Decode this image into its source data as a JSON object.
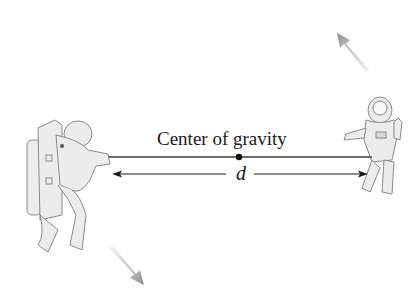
{
  "diagram": {
    "labels": {
      "center_of_gravity": "Center of gravity",
      "distance": "d"
    },
    "elements": {
      "left_figure": "astronaut-with-backpack",
      "right_figure": "astronaut-floating",
      "rope": "tether between astronauts",
      "center_point": "center of gravity dot",
      "distance_arrow": "double-headed arrow labeled d",
      "rotation_arrow_top_right": "motion arrow up-left",
      "rotation_arrow_bottom_left": "motion arrow down-right"
    },
    "colors": {
      "line": "#1a1a1a",
      "rope": "#6e6e6e",
      "figure_fill": "#e8e8e8",
      "figure_stroke": "#8a8a8a",
      "motion_arrow": "#9a9a9a"
    }
  }
}
